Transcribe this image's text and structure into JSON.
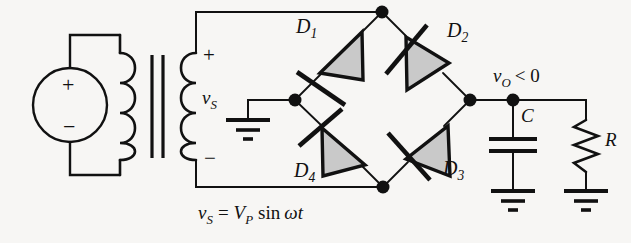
{
  "figure": {
    "background_color": "#f7f6f4",
    "line_color": "#111111",
    "diode_fill_color": "#c9c9c9"
  },
  "source": {
    "plus": "+",
    "minus": "−"
  },
  "secondary": {
    "plus": "+",
    "minus": "−",
    "voltage_symbol": "v",
    "voltage_subscript": "S"
  },
  "diodes": [
    {
      "name": "D",
      "index": "1"
    },
    {
      "name": "D",
      "index": "2"
    },
    {
      "name": "D",
      "index": "3"
    },
    {
      "name": "D",
      "index": "4"
    }
  ],
  "output": {
    "symbol": "v",
    "subscript": "O",
    "relation": "< 0"
  },
  "components": {
    "capacitor": "C",
    "resistor": "R"
  },
  "equation": {
    "lhs_symbol": "v",
    "lhs_subscript": "S",
    "equals": "=",
    "amplitude_symbol": "V",
    "amplitude_subscript": "P",
    "function": "sin",
    "omega": "ω",
    "time": "t"
  }
}
